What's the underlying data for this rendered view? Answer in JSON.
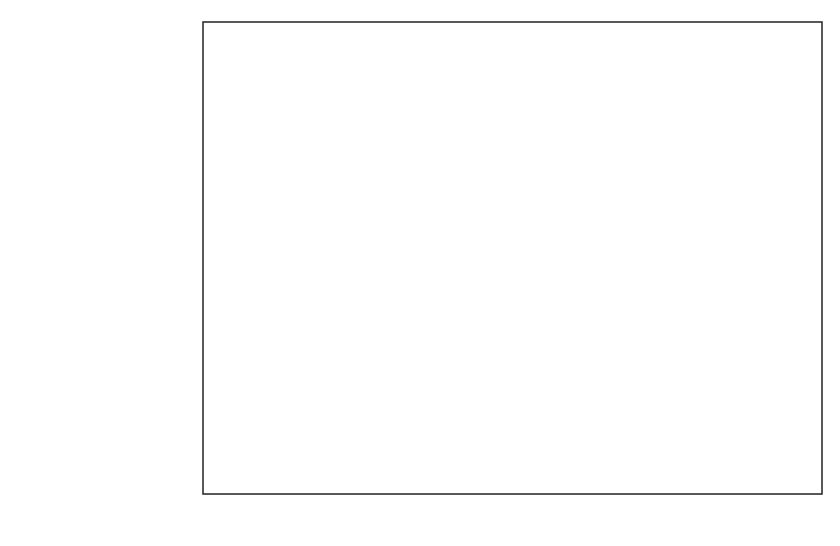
{
  "chart_data": {
    "type": "bar",
    "orientation": "horizontal",
    "title": "",
    "xlabel": "",
    "ylabel": "",
    "categories": [
      "USSR",
      "RSFSR",
      "Ukraine",
      "Belorussia",
      "Estonia",
      "Latvia",
      "Lithuania",
      "Moldavia",
      "Georgia",
      "Armenia",
      "Azerbaijan",
      "Kazakhstan",
      "Turkmenistan",
      "Uzbekistan",
      "Tajikistan",
      "Kirgizia"
    ],
    "values": [
      6.8,
      7.0,
      5.9,
      5.3,
      13.3,
      15.2,
      12.3,
      8.0,
      11.3,
      25.8,
      4.9,
      6.0,
      3.8,
      4.6,
      3.7,
      3.9
    ],
    "xlim": [
      0,
      30
    ],
    "xticks": [
      "0",
      "5",
      "10",
      "15",
      "20",
      "25",
      "30"
    ],
    "grid": "vertical dotted at major ticks",
    "legend": "none",
    "fill_patterns": [
      "dark-dense-hatch",
      "medium-hatch",
      "light-wide-hatch"
    ]
  }
}
